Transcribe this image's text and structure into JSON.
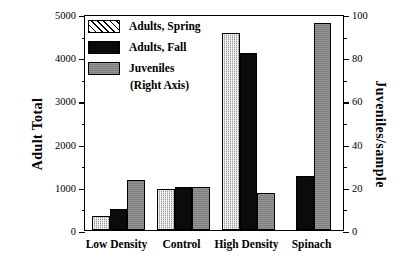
{
  "chart_data": {
    "type": "bar",
    "title": "",
    "categories": [
      "Low Density",
      "Control",
      "High Density",
      "Spinach"
    ],
    "series": [
      {
        "name": "Adults, Spring",
        "axis": "left",
        "values": [
          330,
          950,
          4570,
          null
        ]
      },
      {
        "name": "Adults, Fall",
        "axis": "left",
        "values": [
          480,
          1000,
          4100,
          1250
        ]
      },
      {
        "name": "Juveniles",
        "axis": "right",
        "values": [
          23,
          20,
          17,
          96
        ]
      }
    ],
    "xlabel": "",
    "ylabel": "Adult Total",
    "y2label": "Juveniles/sample",
    "ylim": [
      0,
      5000
    ],
    "y2lim": [
      0,
      100
    ],
    "yticks": [
      0,
      1000,
      2000,
      3000,
      4000,
      5000
    ],
    "yticks_minor": [
      500,
      1500,
      2500,
      3500,
      4500
    ],
    "y2ticks": [
      0,
      20,
      40,
      60,
      80,
      100
    ],
    "y2ticks_minor": [
      10,
      30,
      50,
      70,
      90
    ],
    "grid": false,
    "legend_position": "top-left"
  },
  "axes": {
    "left_title": "Adult Total",
    "right_title": "Juveniles/sample",
    "left_ticklabels": [
      "0",
      "1000",
      "2000",
      "3000",
      "4000",
      "5000"
    ],
    "right_ticklabels": [
      "0",
      "20",
      "40",
      "60",
      "80",
      "100"
    ]
  },
  "legend": {
    "items": [
      {
        "label": "Adults, Spring",
        "sublabel": "",
        "swatch": "hatch-diagonal"
      },
      {
        "label": "Adults, Fall",
        "sublabel": "",
        "swatch": "solid-black"
      },
      {
        "label": "Juveniles",
        "sublabel": "(Right Axis)",
        "swatch": "solid-gray"
      }
    ]
  },
  "xlabels": [
    "Low Density",
    "Control",
    "High Density",
    "Spinach"
  ]
}
